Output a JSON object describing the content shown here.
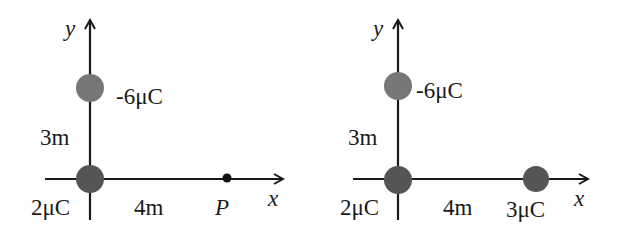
{
  "colors": {
    "axis": "#1a1a1a",
    "charge_negative": "#777777",
    "charge_positive": "#555555",
    "point": "#111111",
    "text": "#1a1a1a"
  },
  "panels": [
    {
      "axis_x_label": "x",
      "axis_y_label": "y",
      "charges": [
        {
          "label": "-6μC",
          "position": "top of y-axis"
        },
        {
          "label": "2μC",
          "position": "origin"
        }
      ],
      "point": {
        "label": "P"
      },
      "distance_vertical": "3m",
      "distance_horizontal": "4m"
    },
    {
      "axis_x_label": "x",
      "axis_y_label": "y",
      "charges": [
        {
          "label": "-6μC",
          "position": "top of y-axis"
        },
        {
          "label": "2μC",
          "position": "origin"
        },
        {
          "label": "3μC",
          "position": "on x-axis"
        }
      ],
      "distance_vertical": "3m",
      "distance_horizontal": "4m"
    }
  ]
}
